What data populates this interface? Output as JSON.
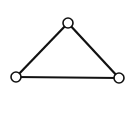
{
  "diagram": {
    "type": "graph",
    "background": "#ffffff",
    "stroke_color": "#111111",
    "node_fill": "#ffffff",
    "nodes": [
      {
        "id": "top",
        "x": 68,
        "y": 23,
        "r": 5
      },
      {
        "id": "left",
        "x": 16,
        "y": 77,
        "r": 5
      },
      {
        "id": "right",
        "x": 119,
        "y": 78,
        "r": 5
      }
    ],
    "edges": [
      {
        "from": "top",
        "to": "left"
      },
      {
        "from": "top",
        "to": "right"
      },
      {
        "from": "left",
        "to": "right"
      }
    ]
  }
}
